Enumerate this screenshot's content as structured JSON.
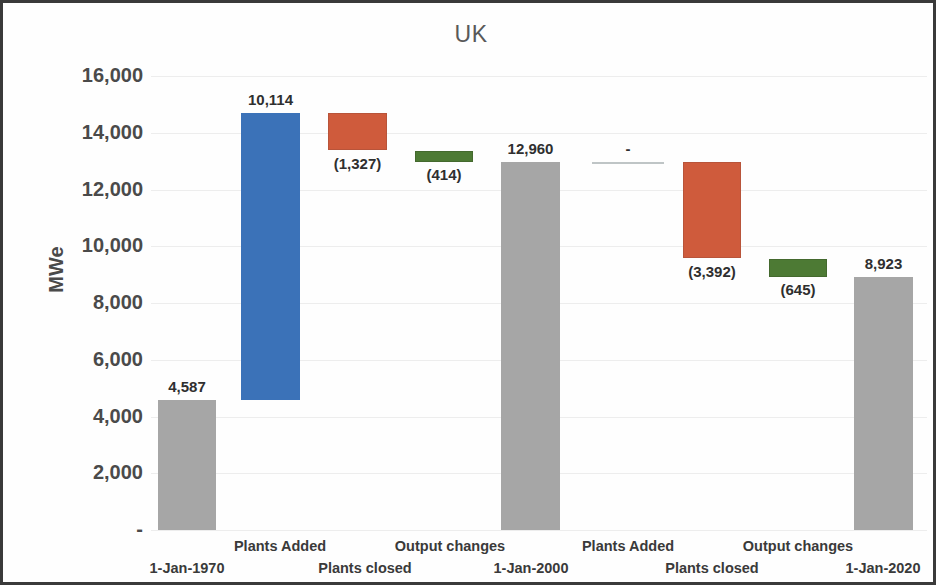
{
  "chart_data": {
    "type": "bar",
    "chart_style": "waterfall",
    "title": "UK",
    "xlabel": "",
    "ylabel": "MWe",
    "ylim": [
      0,
      16000
    ],
    "ytick_labels": [
      "16,000",
      "14,000",
      "12,000",
      "10,000",
      "8,000",
      "6,000",
      "4,000",
      "2,000",
      "-"
    ],
    "ytick_values": [
      16000,
      14000,
      12000,
      10000,
      8000,
      6000,
      4000,
      2000,
      0
    ],
    "grid": true,
    "legend": "none",
    "categories": [
      "1-Jan-1970",
      "Plants Added",
      "Plants closed",
      "Output changes",
      "1-Jan-2000",
      "Plants Added",
      "Plants closed",
      "Output changes",
      "1-Jan-2020"
    ],
    "data_labels": [
      "4,587",
      "10,114",
      "(1,327)",
      "(414)",
      "12,960",
      "-",
      "(3,392)",
      "(645)",
      "8,923"
    ],
    "values": [
      4587,
      10114,
      -1327,
      -414,
      12960,
      0,
      -3392,
      -645,
      8923
    ],
    "bars": [
      {
        "category": "1-Jan-1970",
        "label": "4,587",
        "value": 4587,
        "kind": "total",
        "color": "#a6a6a6",
        "base": 0,
        "top": 4587,
        "x": 155,
        "width": 58,
        "label_pos": "above"
      },
      {
        "category": "Plants Added",
        "label": "10,114",
        "value": 10114,
        "kind": "increase",
        "color": "#3b72b8",
        "base": 4587,
        "top": 14701,
        "x": 238,
        "width": 59,
        "label_pos": "above"
      },
      {
        "category": "Plants closed",
        "label": "(1,327)",
        "value": -1327,
        "kind": "decrease",
        "color": "#cf5b3c",
        "base": 13374,
        "top": 14701,
        "x": 325,
        "width": 59,
        "label_pos": "below"
      },
      {
        "category": "Output changes",
        "label": "(414)",
        "value": -414,
        "kind": "decrease",
        "color": "#4d7a34",
        "base": 12960,
        "top": 13374,
        "x": 412,
        "width": 58,
        "label_pos": "below"
      },
      {
        "category": "1-Jan-2000",
        "label": "12,960",
        "value": 12960,
        "kind": "total",
        "color": "#a6a6a6",
        "base": 0,
        "top": 12960,
        "x": 498,
        "width": 59,
        "label_pos": "above"
      },
      {
        "category": "Plants Added",
        "label": "-",
        "value": 0,
        "kind": "zero",
        "color": "#bfc5c6",
        "base": 12960,
        "top": 12960,
        "x": 589,
        "width": 72,
        "label_pos": "above"
      },
      {
        "category": "Plants closed",
        "label": "(3,392)",
        "value": -3392,
        "kind": "decrease",
        "color": "#cf5b3c",
        "base": 9568,
        "top": 12960,
        "x": 680,
        "width": 58,
        "label_pos": "below"
      },
      {
        "category": "Output changes",
        "label": "(645)",
        "value": -645,
        "kind": "decrease",
        "color": "#4d7a34",
        "base": 8923,
        "top": 9568,
        "x": 766,
        "width": 58,
        "label_pos": "below"
      },
      {
        "category": "1-Jan-2020",
        "label": "8,923",
        "value": 8923,
        "kind": "total",
        "color": "#a6a6a6",
        "base": 0,
        "top": 8923,
        "x": 851,
        "width": 59,
        "label_pos": "above"
      }
    ],
    "xtick_labels": [
      {
        "text": "1-Jan-1970",
        "center": 184,
        "row": 1
      },
      {
        "text": "Plants Added",
        "center": 277,
        "row": 0
      },
      {
        "text": "Plants closed",
        "center": 362,
        "row": 1
      },
      {
        "text": "Output changes",
        "center": 447,
        "row": 0
      },
      {
        "text": "1-Jan-2000",
        "center": 528,
        "row": 1
      },
      {
        "text": "Plants Added",
        "center": 625,
        "row": 0
      },
      {
        "text": "Plants closed",
        "center": 709,
        "row": 1
      },
      {
        "text": "Output changes",
        "center": 795,
        "row": 0
      },
      {
        "text": "1-Jan-2020",
        "center": 880,
        "row": 1
      }
    ],
    "colors": {
      "total": "#a6a6a6",
      "increase": "#3b72b8",
      "decrease_plants": "#cf5b3c",
      "decrease_output": "#4d7a34",
      "zero": "#bfc5c6",
      "grid": "#ededed",
      "text": "#4a4a4a",
      "title": "#595959",
      "border": "#3a3a3a"
    }
  }
}
